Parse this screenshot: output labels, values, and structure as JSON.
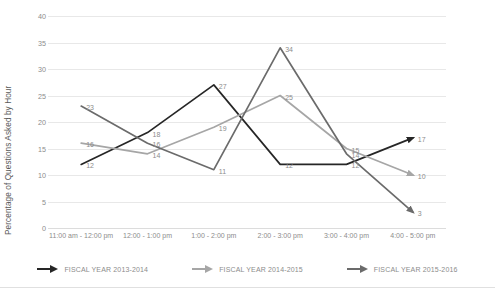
{
  "chart_data": {
    "type": "line",
    "title": "",
    "xlabel": "",
    "ylabel": "Percentage of Questions Asked by Hour",
    "ylim": [
      0,
      40
    ],
    "ytick_step": 5,
    "yticks": [
      "0",
      "5",
      "10",
      "15",
      "20",
      "25",
      "30",
      "35",
      "40"
    ],
    "grid": true,
    "legend_position": "bottom",
    "categories": [
      "11:00 am - 12:00 pm",
      "12:00 - 1:00 pm",
      "1:00 - 2:00 pm",
      "2:00 - 3:00 pm",
      "3:00 - 4:00 pm",
      "4:00 - 5:00 pm"
    ],
    "series": [
      {
        "name": "FISCAL YEAR 2013-2014",
        "color": "#262626",
        "values": [
          12,
          18,
          27,
          12,
          12,
          17
        ],
        "labels": [
          "12",
          "18",
          "27",
          "12",
          "12",
          "17"
        ]
      },
      {
        "name": "FISCAL YEAR 2014-2015",
        "color": "#a6a6a6",
        "values": [
          16,
          14,
          19,
          25,
          15,
          10
        ],
        "labels": [
          "16",
          "14",
          "19",
          "25",
          "15",
          "10"
        ]
      },
      {
        "name": "FISCAL YEAR 2015-2016",
        "color": "#6b6b6b",
        "values": [
          23,
          16,
          11,
          34,
          14,
          3
        ],
        "labels": [
          "23",
          "16",
          "11",
          "34",
          "14",
          "3"
        ]
      }
    ]
  },
  "legend": {
    "items": [
      {
        "label": "FISCAL YEAR 2013-2014",
        "icon": "arrow-right-icon",
        "color": "#262626"
      },
      {
        "label": "FISCAL YEAR 2014-2015",
        "icon": "arrow-right-icon",
        "color": "#a6a6a6"
      },
      {
        "label": "FISCAL YEAR 2015-2016",
        "icon": "arrow-right-icon",
        "color": "#6b6b6b"
      }
    ]
  }
}
